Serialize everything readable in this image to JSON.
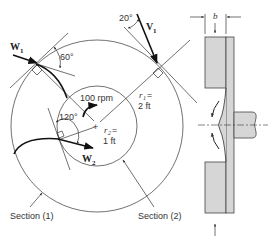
{
  "figure": {
    "type": "pump impeller diagram",
    "colors": {
      "line": "#333333",
      "block_fill": "#d6d6d6",
      "background": "#ffffff"
    }
  },
  "top_view": {
    "rotation_label": "100 rpm",
    "outer_radius": {
      "symbol": "r",
      "subscript": "1",
      "eq": "=",
      "value": "2 ft"
    },
    "inner_radius": {
      "symbol": "r",
      "subscript": "2",
      "eq": "=",
      "value": "1 ft"
    },
    "angles": {
      "exit_blade_angle": "60°",
      "inlet_angle": "120°",
      "absolute_velocity_angle": "20°"
    },
    "vectors": {
      "w1": {
        "symbol": "W",
        "subscript": "1"
      },
      "w2": {
        "symbol": "W",
        "subscript": "2"
      },
      "v1": {
        "symbol": "V",
        "subscript": "1"
      }
    },
    "sections": {
      "section1": "Section (1)",
      "section2": "Section (2)"
    },
    "center_marker": "+"
  },
  "side_view": {
    "width_label": "b"
  }
}
